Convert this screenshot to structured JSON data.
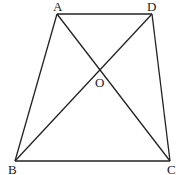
{
  "diagram": {
    "type": "trapezoid with diagonals",
    "points": {
      "A": {
        "label": "A",
        "x": 57,
        "y": 14
      },
      "D": {
        "label": "D",
        "x": 152,
        "y": 14
      },
      "B": {
        "label": "B",
        "x": 15,
        "y": 161
      },
      "C": {
        "label": "C",
        "x": 170,
        "y": 161
      },
      "O": {
        "label": "O",
        "x": 100,
        "y": 70
      }
    },
    "segments": [
      "AD",
      "AB",
      "DC",
      "BC",
      "AC",
      "BD"
    ]
  }
}
